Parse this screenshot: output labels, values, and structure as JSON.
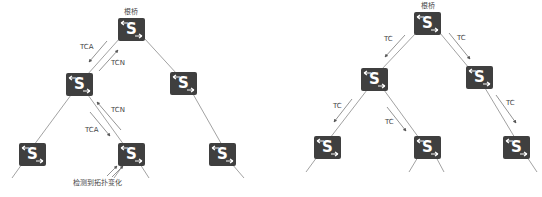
{
  "colors": {
    "switch": "#3f3f3f",
    "line": "#8a8a8a",
    "text": "#444444"
  },
  "switch_glyph": "S",
  "left_diagram": {
    "root_label": "根桥",
    "message_labels": {
      "tca_upper": "TCA",
      "tcn_upper": "TCN",
      "tcn_lower": "TCN",
      "tca_lower": "TCA"
    },
    "detect_label": "检测到拓扑变化",
    "switches": [
      "root",
      "mid-left",
      "mid-right",
      "bottom-left",
      "bottom-mid",
      "bottom-right"
    ]
  },
  "right_diagram": {
    "root_label": "根桥",
    "message_labels": {
      "tc_root_left": "TC",
      "tc_root_right": "TC",
      "tc_midleft_left": "TC",
      "tc_midleft_right": "TC",
      "tc_midright": "TC"
    },
    "switches": [
      "root",
      "mid-left",
      "mid-right",
      "bottom-left",
      "bottom-mid",
      "bottom-right"
    ]
  }
}
